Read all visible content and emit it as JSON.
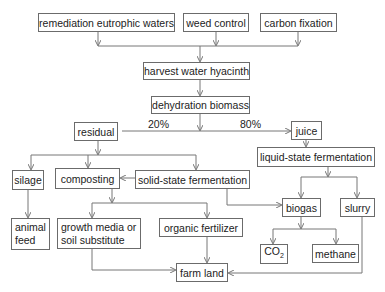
{
  "diagram": {
    "type": "flowchart",
    "nodes": {
      "remediation": "remediation eutrophic waters",
      "weed_control": "weed control",
      "carbon_fixation": "carbon fixation",
      "harvest": "harvest water hyacinth",
      "dehydration": "dehydration biomass",
      "residual": "residual",
      "juice": "juice",
      "silage": "silage",
      "composting": "composting",
      "solid_state": "solid-state fermentation",
      "liquid_state": "liquid-state fermentation",
      "biogas": "biogas",
      "slurry": "slurry",
      "animal_feed": "animal feed",
      "growth_media": "growth media or soil substitute",
      "organic_fertilizer": "organic fertilizer",
      "co2_main": "CO",
      "co2_sub": "2",
      "methane": "methane",
      "farm_land": "farm land"
    },
    "edge_labels": {
      "residual_pct": "20%",
      "juice_pct": "80%"
    },
    "edges": [
      [
        "remediation",
        "harvest"
      ],
      [
        "weed_control",
        "harvest"
      ],
      [
        "carbon_fixation",
        "harvest"
      ],
      [
        "harvest",
        "dehydration"
      ],
      [
        "dehydration",
        "residual"
      ],
      [
        "dehydration",
        "juice"
      ],
      [
        "residual",
        "silage"
      ],
      [
        "residual",
        "composting"
      ],
      [
        "residual",
        "solid_state"
      ],
      [
        "solid_state",
        "composting"
      ],
      [
        "solid_state",
        "biogas"
      ],
      [
        "juice",
        "liquid_state"
      ],
      [
        "liquid_state",
        "biogas"
      ],
      [
        "liquid_state",
        "slurry"
      ],
      [
        "silage",
        "animal_feed"
      ],
      [
        "composting",
        "growth_media"
      ],
      [
        "composting",
        "organic_fertilizer"
      ],
      [
        "biogas",
        "co2"
      ],
      [
        "biogas",
        "methane"
      ],
      [
        "growth_media",
        "farm_land"
      ],
      [
        "organic_fertilizer",
        "farm_land"
      ],
      [
        "slurry",
        "farm_land"
      ]
    ]
  }
}
